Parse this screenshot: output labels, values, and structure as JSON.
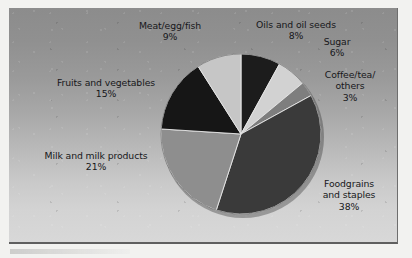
{
  "figure": {
    "background_color": "#f2f2f0",
    "panel": {
      "gradient_top_color": "#8c8c8c",
      "gradient_bottom_color": "#d8d8d8",
      "border_color": "#5f5f5f"
    }
  },
  "chart_data": {
    "type": "pie",
    "title": "",
    "subtitle": "",
    "xlabel": "",
    "ylabel": "",
    "legend_position": "none",
    "labels_position": "outside",
    "grid": false,
    "units": "percent",
    "total": 100,
    "start_angle_deg": 0,
    "direction": "clockwise",
    "categories": [
      "Oils and oil seeds",
      "Sugar",
      "Coffee/tea/ others",
      "Foodgrains and staples",
      "Milk and milk products",
      "Fruits and vegetables",
      "Meat/egg/fish"
    ],
    "values": [
      8,
      6,
      3,
      38,
      21,
      15,
      9
    ],
    "slices": [
      {
        "name": "oils-and-oil-seeds",
        "label_line1": "Oils and oil seeds",
        "label_line2": "",
        "label_line3": "",
        "percent": "8%",
        "value": 8,
        "color": "#1c1c1c"
      },
      {
        "name": "sugar",
        "label_line1": "Sugar",
        "label_line2": "",
        "label_line3": "",
        "percent": "6%",
        "value": 6,
        "color": "#d2d2d2"
      },
      {
        "name": "coffee-tea-others",
        "label_line1": "Coffee/tea/",
        "label_line2": "others",
        "label_line3": "",
        "percent": "3%",
        "value": 3,
        "color": "#7e7e7e"
      },
      {
        "name": "foodgrains-and-staples",
        "label_line1": "Foodgrains",
        "label_line2": "and staples",
        "label_line3": "",
        "percent": "38%",
        "value": 38,
        "color": "#3a3a3a"
      },
      {
        "name": "milk-and-milk-products",
        "label_line1": "Milk and milk products",
        "label_line2": "",
        "label_line3": "",
        "percent": "21%",
        "value": 21,
        "color": "#8e8e8e"
      },
      {
        "name": "fruits-and-vegetables",
        "label_line1": "Fruits and vegetables",
        "label_line2": "",
        "label_line3": "",
        "percent": "15%",
        "value": 15,
        "color": "#161616"
      },
      {
        "name": "meat-egg-fish",
        "label_line1": "Meat/egg/fish",
        "label_line2": "",
        "label_line3": "",
        "percent": "9%",
        "value": 9,
        "color": "#c6c6c6"
      }
    ],
    "geometry": {
      "center_x": 241,
      "center_y": 134,
      "radius": 80
    }
  }
}
